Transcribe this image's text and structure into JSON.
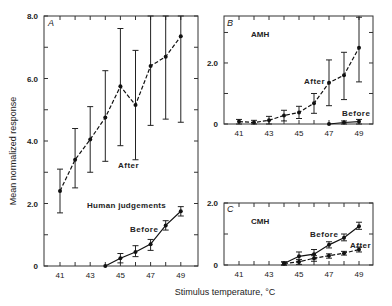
{
  "figure": {
    "ylabel": "Mean normalized response",
    "xlabel": "Stimulus temperature, °C"
  },
  "chart_data": [
    {
      "panel": "A",
      "type": "line",
      "subtitle": "Human judgements",
      "x": [
        41,
        42,
        43,
        44,
        45,
        46,
        47,
        48,
        49
      ],
      "xticks": [
        "41",
        "43",
        "45",
        "47",
        "49"
      ],
      "yticks": [
        "0",
        "2.0",
        "4.0",
        "6.0",
        "8.0"
      ],
      "ylim": [
        0,
        8
      ],
      "series": [
        {
          "name": "After",
          "style": "dashed",
          "x": [
            41,
            42,
            43,
            44,
            45,
            46,
            47,
            48,
            49
          ],
          "values": [
            2.4,
            3.4,
            4.05,
            4.75,
            5.75,
            5.15,
            6.4,
            6.7,
            7.35
          ],
          "err_low": [
            1.7,
            2.5,
            3.0,
            3.35,
            3.85,
            3.4,
            4.5,
            4.7,
            4.6
          ],
          "err_high": [
            3.1,
            4.4,
            5.1,
            6.25,
            7.6,
            6.9,
            8.0,
            8.0,
            8.0
          ]
        },
        {
          "name": "Before",
          "style": "solid",
          "x": [
            44,
            45,
            46,
            47,
            48,
            49
          ],
          "values": [
            0,
            0.25,
            0.45,
            0.7,
            1.3,
            1.75
          ],
          "err_low": [
            0,
            0.1,
            0.3,
            0.5,
            1.15,
            1.6
          ],
          "err_high": [
            0,
            0.4,
            0.65,
            0.85,
            1.45,
            1.9
          ]
        }
      ]
    },
    {
      "panel": "B",
      "type": "line",
      "subtitle": "AMH",
      "xticks": [
        "41",
        "43",
        "45",
        "47",
        "49"
      ],
      "yticks": [
        "0",
        "2.0"
      ],
      "ylim": [
        0,
        3.5
      ],
      "series": [
        {
          "name": "After",
          "style": "dashed",
          "x": [
            41,
            42,
            43,
            44,
            45,
            46,
            47,
            48,
            49
          ],
          "values": [
            0.08,
            0.05,
            0.12,
            0.28,
            0.38,
            0.68,
            1.35,
            1.6,
            2.5
          ],
          "err_low": [
            0.0,
            0.0,
            0.0,
            0.1,
            0.18,
            0.35,
            0.6,
            0.8,
            1.38
          ],
          "err_high": [
            0.15,
            0.12,
            0.25,
            0.45,
            0.58,
            1.0,
            2.1,
            2.35,
            3.5
          ]
        },
        {
          "name": "Before",
          "style": "solid",
          "x": [
            47,
            48,
            49
          ],
          "values": [
            0,
            0.05,
            0.08
          ],
          "err_low": [
            0,
            0.0,
            0.0
          ],
          "err_high": [
            0,
            0.1,
            0.15
          ]
        }
      ]
    },
    {
      "panel": "C",
      "type": "line",
      "subtitle": "CMH",
      "xticks": [
        "41",
        "43",
        "45",
        "47",
        "49"
      ],
      "yticks": [
        "0",
        "2.0"
      ],
      "ylim": [
        0,
        2
      ],
      "series": [
        {
          "name": "Before",
          "style": "solid",
          "x": [
            44,
            45,
            46,
            47,
            48,
            49
          ],
          "values": [
            0.05,
            0.28,
            0.35,
            0.65,
            0.88,
            1.25
          ],
          "err_low": [
            0.0,
            0.12,
            0.2,
            0.55,
            0.78,
            1.15
          ],
          "err_high": [
            0.1,
            0.42,
            0.5,
            0.75,
            1.0,
            1.38
          ]
        },
        {
          "name": "After",
          "style": "dashed",
          "x": [
            44,
            45,
            46,
            47,
            48,
            49
          ],
          "values": [
            0.05,
            0.1,
            0.22,
            0.3,
            0.38,
            0.5
          ],
          "err_low": [
            0.0,
            0.02,
            0.12,
            0.22,
            0.32,
            0.42
          ],
          "err_high": [
            0.1,
            0.18,
            0.3,
            0.36,
            0.44,
            0.58
          ]
        }
      ]
    }
  ],
  "labels": {
    "A": {
      "letter": "A",
      "after": "After",
      "before": "Before",
      "title": "Human judgements"
    },
    "B": {
      "letter": "B",
      "after": "After",
      "before": "Before",
      "title": "AMH"
    },
    "C": {
      "letter": "C",
      "after": "After",
      "before": "Before",
      "title": "CMH"
    }
  }
}
